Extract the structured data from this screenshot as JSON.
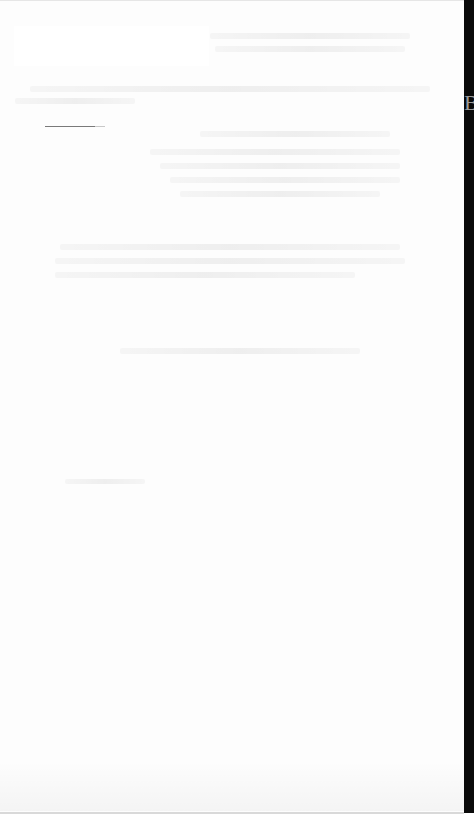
{
  "document": {
    "header_lines": [
      "",
      ""
    ],
    "section_1_lines": [
      "",
      "",
      "",
      "",
      ""
    ],
    "section_2_lines": [
      "",
      "",
      ""
    ],
    "section_3_line": "",
    "mid_fragment": "",
    "edge_glyph": "B"
  },
  "colors": {
    "page_background": "#fdfdfd",
    "edge_strip": "#0a0a0a",
    "dash": "#7a7a7a"
  }
}
